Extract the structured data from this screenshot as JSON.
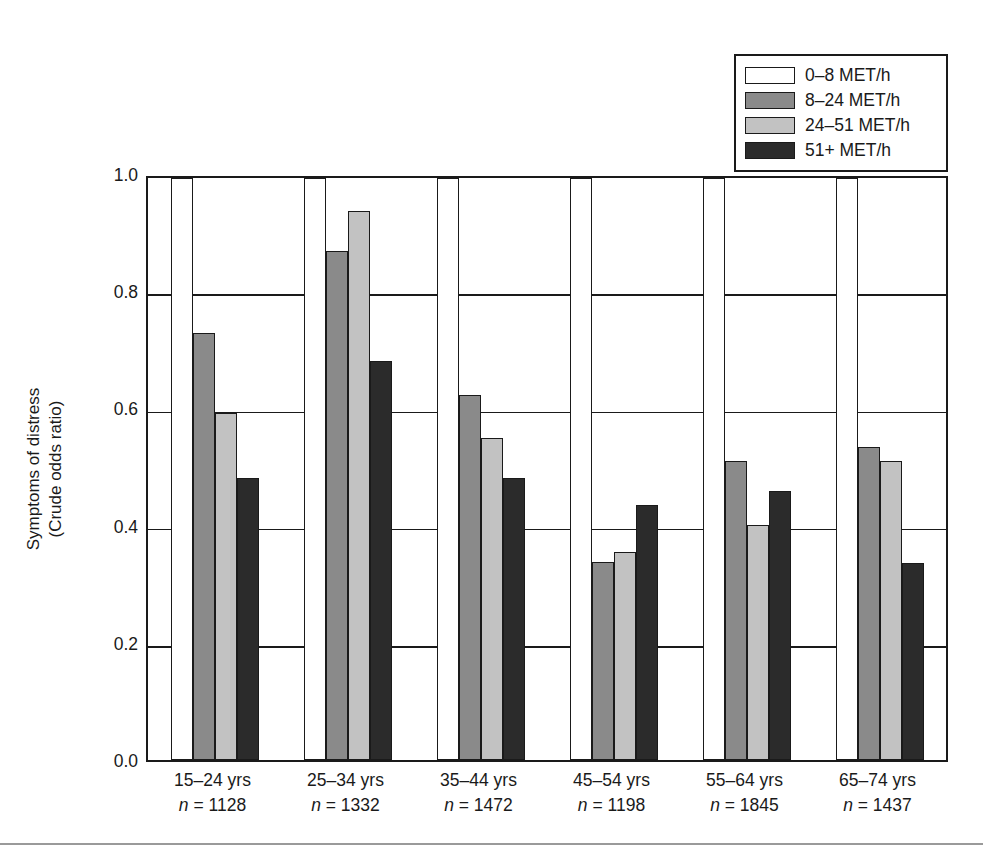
{
  "chart_data": {
    "type": "bar",
    "title": "",
    "xlabel": "",
    "ylabel": "Symptoms of distress",
    "ylabel_line2": "(Crude odds ratio)",
    "ylim": [
      0.0,
      1.0
    ],
    "yticks": [
      "0.0",
      "0.2",
      "0.4",
      "0.6",
      "0.8",
      "1.0"
    ],
    "ytick_values": [
      0.0,
      0.2,
      0.4,
      0.6,
      0.8,
      1.0
    ],
    "grid": true,
    "legend_position": "top-right",
    "categories": [
      "15–24 yrs",
      "25–34 yrs",
      "35–44 yrs",
      "45–54 yrs",
      "55–64 yrs",
      "65–74 yrs"
    ],
    "category_counts": [
      "n = 1128",
      "n = 1332",
      "n = 1472",
      "n = 1198",
      "n = 1845",
      "n = 1437"
    ],
    "series": [
      {
        "name": "0–8 MET/h",
        "color": "#ffffff",
        "values": [
          1.0,
          1.0,
          1.0,
          1.0,
          1.0,
          1.0
        ]
      },
      {
        "name": "8–24 MET/h",
        "color": "#8a8a8a",
        "values": [
          0.734,
          0.875,
          0.628,
          0.34,
          0.514,
          0.537
        ]
      },
      {
        "name": "24–51 MET/h",
        "color": "#c2c2c2",
        "values": [
          0.597,
          0.944,
          0.553,
          0.358,
          0.404,
          0.513
        ]
      },
      {
        "name": "51+ MET/h",
        "color": "#2b2b2b",
        "values": [
          0.484,
          0.685,
          0.484,
          0.439,
          0.462,
          0.338
        ]
      }
    ]
  },
  "legend": {
    "items": [
      {
        "label": "0–8 MET/h"
      },
      {
        "label": "8–24 MET/h"
      },
      {
        "label": "24–51 MET/h"
      },
      {
        "label": "51+ MET/h"
      }
    ]
  },
  "axis": {
    "y_title_line1": "Symptoms of distress",
    "y_title_line2": "(Crude odds ratio)"
  }
}
